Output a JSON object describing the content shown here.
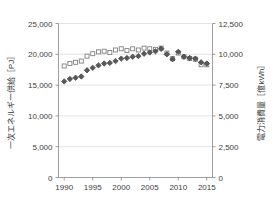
{
  "chart_data": {
    "type": "scatter",
    "title": "",
    "xlabel": "",
    "ylabel": "一次エネルギー供給［PJ］",
    "y2label": "電力消費量［億kWh］",
    "grid": true,
    "legend": "none",
    "x": [
      1990,
      1991,
      1992,
      1993,
      1994,
      1995,
      1996,
      1997,
      1998,
      1999,
      2000,
      2001,
      2002,
      2003,
      2004,
      2005,
      2006,
      2007,
      2008,
      2009,
      2010,
      2011,
      2012,
      2013,
      2014,
      2015
    ],
    "xlim": [
      1989,
      2016
    ],
    "xticks": [
      1990,
      1995,
      2000,
      2005,
      2010,
      2015
    ],
    "xtick_labels": [
      "1990",
      "1995",
      "2000",
      "2005",
      "2010",
      "2015"
    ],
    "ylim": [
      0,
      25000
    ],
    "yticks": [
      0,
      5000,
      10000,
      15000,
      20000,
      25000
    ],
    "ytick_labels": [
      "0",
      "5,000",
      "10,000",
      "15,000",
      "20,000",
      "25,000"
    ],
    "y2lim": [
      0,
      12500
    ],
    "y2ticks": [
      0,
      2500,
      5000,
      7500,
      10000,
      12500
    ],
    "y2tick_labels": [
      "0",
      "2,500",
      "5,000",
      "7,500",
      "10,000",
      "12,500"
    ],
    "series": [
      {
        "name": "一次エネルギー供給",
        "axis": "left",
        "marker": "open-square",
        "marker_fill": "#ffffff",
        "marker_stroke": "#808080",
        "values": [
          18100,
          18500,
          18700,
          18900,
          19700,
          20100,
          20400,
          20500,
          20300,
          20700,
          20900,
          20600,
          20900,
          20700,
          21000,
          20900,
          20800,
          21000,
          20200,
          19300,
          20200,
          19600,
          19300,
          19200,
          18300,
          18300
        ]
      },
      {
        "name": "電力消費量",
        "axis": "right",
        "marker": "filled-diamond",
        "marker_fill": "#595959",
        "marker_stroke": "#3f3f3f",
        "values": [
          7800,
          8000,
          8100,
          8200,
          8700,
          8900,
          9100,
          9250,
          9300,
          9450,
          9650,
          9700,
          9800,
          9850,
          10050,
          10150,
          10250,
          10450,
          10000,
          9600,
          10200,
          9800,
          9700,
          9650,
          9350,
          9250
        ]
      }
    ]
  },
  "colors": {
    "axis_line": "#888888",
    "grid_line": "#d9d9d9",
    "tick_text": "#404040",
    "series1_stroke": "#808080",
    "series1_fill": "#ffffff",
    "series2_fill": "#595959",
    "series2_stroke": "#3f3f3f",
    "background": "#ffffff"
  }
}
